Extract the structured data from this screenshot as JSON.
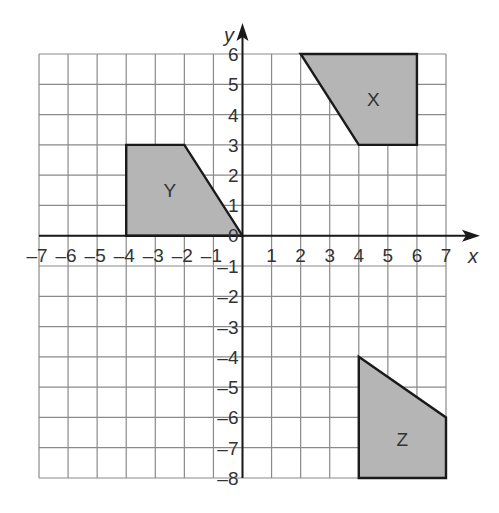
{
  "chart_data": {
    "type": "coordinate-grid",
    "xlabel": "x",
    "ylabel": "y",
    "xlim": [
      -7,
      7
    ],
    "ylim": [
      -8,
      6
    ],
    "grid": true,
    "x_ticks": [
      -7,
      -6,
      -5,
      -4,
      -3,
      -2,
      -1,
      1,
      2,
      3,
      4,
      5,
      6,
      7
    ],
    "y_ticks": [
      6,
      5,
      4,
      3,
      2,
      1,
      0,
      -1,
      -2,
      -3,
      -4,
      -5,
      -6,
      -7,
      -8
    ],
    "shapes": [
      {
        "label": "X",
        "vertices": [
          [
            2,
            6
          ],
          [
            6,
            6
          ],
          [
            6,
            3
          ],
          [
            4,
            3
          ]
        ],
        "label_pos": [
          4.5,
          4.5
        ],
        "fill": "#b5b5b5"
      },
      {
        "label": "Y",
        "vertices": [
          [
            -4,
            3
          ],
          [
            -2,
            3
          ],
          [
            0,
            0
          ],
          [
            -4,
            0
          ]
        ],
        "label_pos": [
          -2.5,
          1.5
        ],
        "fill": "#b5b5b5"
      },
      {
        "label": "Z",
        "vertices": [
          [
            4,
            -4
          ],
          [
            7,
            -6
          ],
          [
            7,
            -8
          ],
          [
            4,
            -8
          ]
        ],
        "label_pos": [
          5.5,
          -6.7
        ],
        "fill": "#b5b5b5"
      }
    ]
  }
}
